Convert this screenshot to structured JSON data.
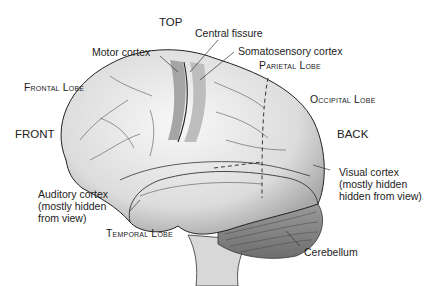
{
  "diagram": {
    "orientation": {
      "top": "TOP",
      "front": "FRONT",
      "back": "BACK"
    },
    "lobes": {
      "frontal": "Frontal Lobe",
      "parietal": "Parietal Lobe",
      "occipital": "Occipital Lobe",
      "temporal": "Temporal Lobe"
    },
    "structures": {
      "motor_cortex": "Motor cortex",
      "central_fissure": "Central fissure",
      "somatosensory_cortex": "Somatosensory cortex",
      "auditory_cortex": [
        "Auditory cortex",
        "(mostly hidden",
        "from view)"
      ],
      "visual_cortex": [
        "Visual cortex",
        "(mostly hidden",
        "hidden from view)"
      ],
      "cerebellum": "Cerebellum"
    },
    "colors": {
      "brain_fill": "#e6e6e6",
      "cortex_strip": "#9a9a9a",
      "cerebellum": "#8a8a8a",
      "outline": "#222222"
    }
  }
}
